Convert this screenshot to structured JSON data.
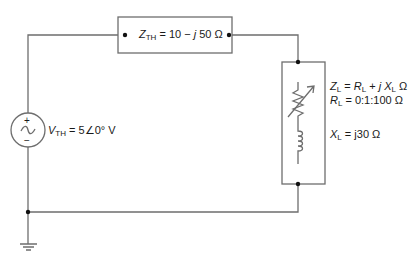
{
  "diagram": {
    "type": "circuit-schematic",
    "colors": {
      "wire": "#6e6e6e",
      "node": "#111111",
      "text": "#1a1a1a",
      "background": "#ffffff"
    },
    "source": {
      "name": "Thevenin voltage source",
      "symbol": "ac-voltage-source",
      "plus": "+",
      "minus": "−",
      "label_var": "V",
      "label_sub": "TH",
      "label_value": " = 5∠0° V"
    },
    "thevenin_impedance": {
      "label_var": "Z",
      "label_sub": "TH",
      "label_eq": " = 10 − ",
      "label_j": "j",
      "label_value": " 50 Ω"
    },
    "load": {
      "z_var": "Z",
      "z_sub": "L",
      "z_eq": " = ",
      "z_r_var": "R",
      "z_r_sub": "L",
      "z_plus": " + ",
      "z_j": "j",
      "z_x_var": " X",
      "z_x_sub": "L",
      "z_unit": " Ω",
      "r_var": "R",
      "r_sub": "L",
      "r_value": " = 0:1:100 Ω",
      "x_var": "X",
      "x_sub": "L",
      "x_value": " = j30 Ω"
    },
    "ground": {
      "symbol": "ground"
    }
  }
}
